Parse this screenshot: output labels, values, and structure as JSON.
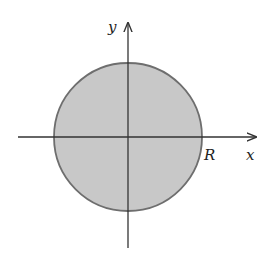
{
  "diagram": {
    "type": "disk-in-cartesian-plane",
    "axes": {
      "x_label": "x",
      "y_label": "y"
    },
    "disk": {
      "radius_label": "R",
      "fill_color": "#c8c8c8",
      "stroke_color": "#6e6e6e"
    },
    "axis_color": "#333333"
  }
}
